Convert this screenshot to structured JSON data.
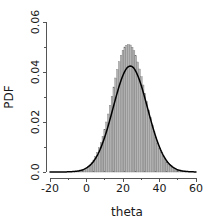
{
  "chart_data": {
    "type": "bar",
    "title": "",
    "xlabel": "theta",
    "ylabel": "PDF",
    "xlim": [
      -20,
      60
    ],
    "ylim": [
      0,
      0.06
    ],
    "grid": false,
    "legend": null,
    "x_ticks": [
      "-20",
      "0",
      "20",
      "40",
      "60"
    ],
    "x_tick_values": [
      -20,
      0,
      20,
      40,
      60
    ],
    "x_minor_tick_values": [
      -10,
      10,
      30,
      50
    ],
    "y_ticks": [
      "0.0",
      "0.02",
      "0.04",
      "0.06"
    ],
    "y_tick_values": [
      0,
      0.02,
      0.04,
      0.06
    ],
    "y_minor_tick_values": [
      0.01,
      0.03,
      0.05
    ],
    "series": [
      {
        "name": "histogram",
        "type": "histogram",
        "bin_width": 1,
        "fill_color": "#b4b4b4",
        "edge_color": "#6e6e6e",
        "bin_centers": [
          -6,
          -5,
          -4,
          -3,
          -2,
          -1,
          0,
          1,
          2,
          3,
          4,
          5,
          6,
          7,
          8,
          9,
          10,
          11,
          12,
          13,
          14,
          15,
          16,
          17,
          18,
          19,
          20,
          21,
          22,
          23,
          24,
          25,
          26,
          27,
          28,
          29,
          30,
          31,
          32,
          33,
          34,
          35,
          36,
          37,
          38,
          39,
          40,
          41,
          42,
          43,
          44,
          45,
          46,
          47,
          48,
          49,
          50,
          51,
          52,
          53,
          54
        ],
        "values": [
          0.0002,
          0.0003,
          0.0004,
          0.0006,
          0.0008,
          0.0011,
          0.0015,
          0.0021,
          0.0028,
          0.0037,
          0.0048,
          0.0062,
          0.0078,
          0.0097,
          0.0118,
          0.0143,
          0.017,
          0.02,
          0.0232,
          0.0267,
          0.0303,
          0.034,
          0.0376,
          0.041,
          0.0441,
          0.0467,
          0.0487,
          0.05,
          0.0507,
          0.051,
          0.0508,
          0.0499,
          0.0485,
          0.0465,
          0.044,
          0.0412,
          0.0381,
          0.0348,
          0.0314,
          0.0281,
          0.0248,
          0.0217,
          0.0188,
          0.0161,
          0.0137,
          0.0115,
          0.0095,
          0.0078,
          0.0063,
          0.005,
          0.004,
          0.0031,
          0.0024,
          0.0018,
          0.0013,
          0.001,
          0.0007,
          0.0005,
          0.0004,
          0.0003,
          0.0002
        ]
      },
      {
        "name": "density",
        "type": "line",
        "color": "#000000",
        "mean": 24,
        "sd": 9.4,
        "peak": 0.0424,
        "x": [
          -20,
          -18,
          -16,
          -14,
          -12,
          -10,
          -8,
          -6,
          -4,
          -2,
          0,
          2,
          4,
          6,
          8,
          10,
          12,
          14,
          16,
          18,
          20,
          22,
          24,
          26,
          28,
          30,
          32,
          34,
          36,
          38,
          40,
          42,
          44,
          46,
          48,
          50,
          52,
          54,
          56,
          58,
          60
        ],
        "values": [
          2e-05,
          4e-05,
          9e-05,
          0.00019,
          0.00037,
          0.0007,
          0.00126,
          0.00216,
          0.00354,
          0.00553,
          0.00824,
          0.01172,
          0.01591,
          0.02061,
          0.02547,
          0.03005,
          0.03386,
          0.03648,
          0.03764,
          0.03728,
          0.03553,
          0.03272,
          0.02927,
          0.02558,
          0.02199,
          0.01871,
          0.01584,
          0.01338,
          0.01127,
          0.00944,
          0.00785,
          0.00645,
          0.00523,
          0.00417,
          0.00327,
          0.00251,
          0.00188,
          0.00138,
          0.00099,
          0.00069,
          0.00047
        ]
      }
    ]
  }
}
